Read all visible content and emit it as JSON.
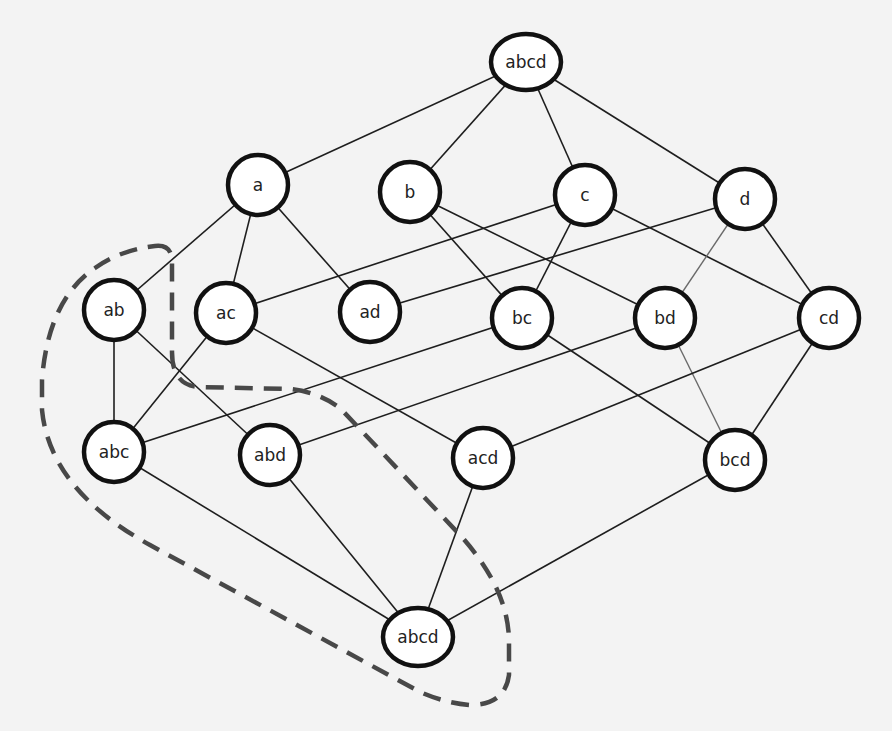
{
  "diagram": {
    "type": "subset-lattice",
    "background_color": "#f3f3f3",
    "node_stroke_color": "#111111",
    "edge_color": "#1e1e1e",
    "dashed_region_color": "#484848",
    "nodes": [
      {
        "id": "top",
        "label": "abcd",
        "level": 0,
        "x": 526,
        "y": 62,
        "rx": 35,
        "ry": 28
      },
      {
        "id": "a",
        "label": "a",
        "level": 1,
        "x": 258,
        "y": 185,
        "rx": 30,
        "ry": 30
      },
      {
        "id": "b",
        "label": "b",
        "level": 1,
        "x": 410,
        "y": 192,
        "rx": 30,
        "ry": 30
      },
      {
        "id": "c",
        "label": "c",
        "level": 1,
        "x": 585,
        "y": 195,
        "rx": 30,
        "ry": 30
      },
      {
        "id": "d",
        "label": "d",
        "level": 1,
        "x": 745,
        "y": 199,
        "rx": 30,
        "ry": 30
      },
      {
        "id": "ab",
        "label": "ab",
        "level": 2,
        "x": 114,
        "y": 310,
        "rx": 30,
        "ry": 30
      },
      {
        "id": "ac",
        "label": "ac",
        "level": 2,
        "x": 226,
        "y": 313,
        "rx": 30,
        "ry": 30
      },
      {
        "id": "ad",
        "label": "ad",
        "level": 2,
        "x": 370,
        "y": 312,
        "rx": 30,
        "ry": 30
      },
      {
        "id": "bc",
        "label": "bc",
        "level": 2,
        "x": 522,
        "y": 318,
        "rx": 30,
        "ry": 30
      },
      {
        "id": "bd",
        "label": "bd",
        "level": 2,
        "x": 665,
        "y": 318,
        "rx": 30,
        "ry": 30
      },
      {
        "id": "cd",
        "label": "cd",
        "level": 2,
        "x": 829,
        "y": 318,
        "rx": 30,
        "ry": 30
      },
      {
        "id": "abc",
        "label": "abc",
        "level": 3,
        "x": 114,
        "y": 452,
        "rx": 30,
        "ry": 30
      },
      {
        "id": "abd",
        "label": "abd",
        "level": 3,
        "x": 270,
        "y": 455,
        "rx": 30,
        "ry": 30
      },
      {
        "id": "acd",
        "label": "acd",
        "level": 3,
        "x": 483,
        "y": 458,
        "rx": 30,
        "ry": 30
      },
      {
        "id": "bcd",
        "label": "bcd",
        "level": 3,
        "x": 735,
        "y": 460,
        "rx": 30,
        "ry": 30
      },
      {
        "id": "bottom",
        "label": "abcd",
        "level": 4,
        "x": 418,
        "y": 637,
        "rx": 35,
        "ry": 29
      }
    ],
    "edges": [
      {
        "from": "top",
        "to": "a"
      },
      {
        "from": "top",
        "to": "b"
      },
      {
        "from": "top",
        "to": "c"
      },
      {
        "from": "top",
        "to": "d"
      },
      {
        "from": "a",
        "to": "ab"
      },
      {
        "from": "a",
        "to": "ac"
      },
      {
        "from": "a",
        "to": "ad"
      },
      {
        "from": "b",
        "to": "bc"
      },
      {
        "from": "b",
        "to": "bd"
      },
      {
        "from": "c",
        "to": "ac"
      },
      {
        "from": "c",
        "to": "bc"
      },
      {
        "from": "c",
        "to": "cd"
      },
      {
        "from": "d",
        "to": "ad"
      },
      {
        "from": "d",
        "to": "bd",
        "style": "light"
      },
      {
        "from": "d",
        "to": "cd"
      },
      {
        "from": "ab",
        "to": "abc"
      },
      {
        "from": "ab",
        "to": "abd"
      },
      {
        "from": "ac",
        "to": "abc"
      },
      {
        "from": "ac",
        "to": "acd"
      },
      {
        "from": "bc",
        "to": "abc"
      },
      {
        "from": "bc",
        "to": "bcd"
      },
      {
        "from": "bd",
        "to": "abd"
      },
      {
        "from": "bd",
        "to": "bcd",
        "style": "light"
      },
      {
        "from": "cd",
        "to": "acd"
      },
      {
        "from": "cd",
        "to": "bcd"
      },
      {
        "from": "abc",
        "to": "bottom"
      },
      {
        "from": "abd",
        "to": "bottom"
      },
      {
        "from": "acd",
        "to": "bottom"
      },
      {
        "from": "bcd",
        "to": "bottom"
      }
    ],
    "dashed_region": {
      "encloses": [
        "ab",
        "abc",
        "abd",
        "bottom"
      ],
      "path": "M 155 246 Q 172 244 172 262 L 172 352 Q 172 386 200 387 L 290 389 Q 318 392 340 408 L 460 535 Q 508 588 509 640 L 509 675 Q 505 705 470 705 Q 445 703 420 692 L 150 545 Q 50 490 42 410 L 42 380 Q 48 300 95 268 Q 120 250 155 246 Z"
    }
  }
}
